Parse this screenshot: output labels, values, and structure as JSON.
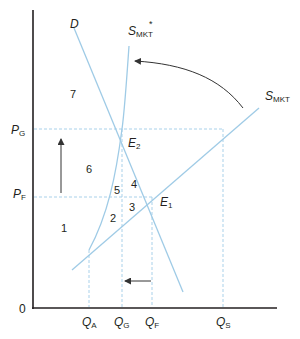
{
  "diagram": {
    "type": "supply-demand",
    "colors": {
      "axis": "#231f20",
      "curve": "#9fcbe6",
      "guide": "#a9d1ea",
      "arrow": "#333333",
      "text": "#231f20"
    },
    "axes": {
      "origin_label": "0"
    },
    "price_labels": [
      {
        "main": "P",
        "sub": "G"
      },
      {
        "main": "P",
        "sub": "F"
      }
    ],
    "quantity_labels": [
      {
        "main": "Q",
        "sub": "A"
      },
      {
        "main": "Q",
        "sub": "G"
      },
      {
        "main": "Q",
        "sub": "F"
      },
      {
        "main": "Q",
        "sub": "S"
      }
    ],
    "curves": {
      "demand": {
        "label": "D"
      },
      "supply_market": {
        "main": "S",
        "sub": "MKT"
      },
      "supply_market_star": {
        "main": "S",
        "sub": "MKT",
        "sup": "*"
      }
    },
    "equilibria": [
      {
        "main": "E",
        "sub": "2"
      },
      {
        "main": "E",
        "sub": "1"
      }
    ],
    "regions": [
      "1",
      "2",
      "3",
      "4",
      "5",
      "6",
      "7"
    ]
  }
}
